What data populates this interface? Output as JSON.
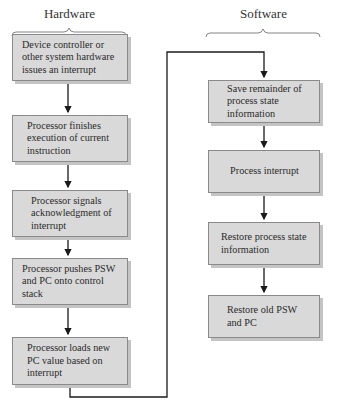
{
  "headings": {
    "hardware": "Hardware",
    "software": "Software"
  },
  "hardware_steps": [
    {
      "label": "Device controller or other system hardware issues an interrupt"
    },
    {
      "label": "Processor finishes execution of current instruction"
    },
    {
      "label": "Processor signals acknowledgment of interrupt"
    },
    {
      "label": "Processor pushes PSW and PC onto control stack"
    },
    {
      "label": "Processor loads new PC value based on interrupt"
    }
  ],
  "software_steps": [
    {
      "label": "Save remainder of process state information"
    },
    {
      "label": "Process interrupt"
    },
    {
      "label": "Restore process state information"
    },
    {
      "label": "Restore old PSW and PC"
    }
  ],
  "colors": {
    "box_fill": "#d9d9d9",
    "box_border": "#8a8a8a",
    "line": "#1a1a1a"
  }
}
